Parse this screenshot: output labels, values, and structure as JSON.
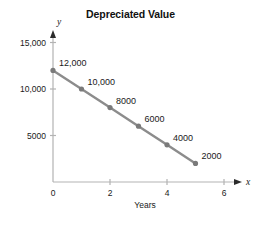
{
  "chart_data": {
    "type": "line",
    "title": "Depreciated Value",
    "xlabel": "Years",
    "ylabel": "Dollars",
    "x": [
      0,
      1,
      2,
      3,
      4,
      5
    ],
    "values": [
      12000,
      10000,
      8000,
      6000,
      4000,
      2000
    ],
    "point_labels": [
      "12,000",
      "10,000",
      "8000",
      "6000",
      "4000",
      "2000"
    ],
    "xlim": [
      0,
      6.4
    ],
    "ylim": [
      0,
      16000
    ],
    "xticks": [
      0,
      2,
      4,
      6
    ],
    "xtick_labels": [
      "0",
      "2",
      "4",
      "6"
    ],
    "yticks": [
      5000,
      10000,
      15000
    ],
    "ytick_labels": [
      "5000",
      "10,000",
      "15,000"
    ],
    "x_axis_variable": "x",
    "y_axis_variable": "y",
    "grid": false,
    "legend": null,
    "series_color": "#8c8c8c",
    "marker_color": "#7a7a7a",
    "axis_color": "#b3b3b3",
    "text_color": "#1a1a1a"
  }
}
